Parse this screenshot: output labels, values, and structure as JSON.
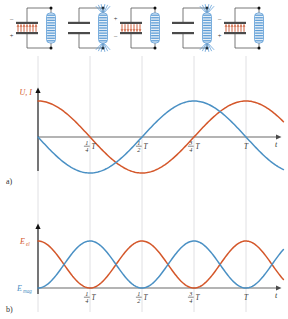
{
  "figure": {
    "panel_labels": {
      "a": "a)",
      "b": "b)"
    },
    "colors": {
      "orange": "#d4572a",
      "blue": "#4a90c4",
      "axis": "#6b6b6b",
      "guide": "#d8d8dc",
      "plate_dark": "#4a4a4a",
      "field_red": "#c8502a",
      "coil_blue": "#5b9bd5",
      "wire": "#555555"
    }
  },
  "circuits": [
    {
      "index": 0,
      "phase_label": "0",
      "capacitor": {
        "charged": true,
        "top_sign": "–",
        "bottom_sign": "+",
        "field_lines": true
      },
      "coil": {
        "field_lines": false
      }
    },
    {
      "index": 1,
      "phase_label": "1/4 T",
      "capacitor": {
        "charged": false,
        "top_sign": "",
        "bottom_sign": "",
        "field_lines": false
      },
      "coil": {
        "field_lines": true
      }
    },
    {
      "index": 2,
      "phase_label": "1/2 T",
      "capacitor": {
        "charged": true,
        "top_sign": "+",
        "bottom_sign": "–",
        "field_lines": true
      },
      "coil": {
        "field_lines": false
      }
    },
    {
      "index": 3,
      "phase_label": "3/4 T",
      "capacitor": {
        "charged": false,
        "top_sign": "",
        "bottom_sign": "",
        "field_lines": false
      },
      "coil": {
        "field_lines": true
      }
    },
    {
      "index": 4,
      "phase_label": "T",
      "capacitor": {
        "charged": true,
        "top_sign": "–",
        "bottom_sign": "+",
        "field_lines": true
      },
      "coil": {
        "field_lines": false
      }
    }
  ],
  "chart_data": [
    {
      "id": "panel-a",
      "type": "line",
      "title": "",
      "ylabel": "U, I",
      "xlabel": "t",
      "xticks": [
        "¼ T",
        "½ T",
        "¾ T",
        "T"
      ],
      "xtick_values": [
        0.25,
        0.5,
        0.75,
        1.0
      ],
      "xlim": [
        0,
        1.18
      ],
      "ylim": [
        -1.15,
        1.15
      ],
      "grid": true,
      "legend": "none",
      "series": [
        {
          "name": "U",
          "color": "#d4572a",
          "function": "cos(2*pi*t/T)",
          "x": [
            0,
            0.0625,
            0.125,
            0.1875,
            0.25,
            0.3125,
            0.375,
            0.4375,
            0.5,
            0.5625,
            0.625,
            0.6875,
            0.75,
            0.8125,
            0.875,
            0.9375,
            1.0,
            1.0625,
            1.125
          ],
          "values": [
            1.0,
            0.924,
            0.707,
            0.383,
            0.0,
            -0.383,
            -0.707,
            -0.924,
            -1.0,
            -0.924,
            -0.707,
            -0.383,
            0.0,
            0.383,
            0.707,
            0.924,
            1.0,
            0.924,
            0.707
          ]
        },
        {
          "name": "I",
          "color": "#4a90c4",
          "function": "-sin(2*pi*t/T)",
          "x": [
            0,
            0.0625,
            0.125,
            0.1875,
            0.25,
            0.3125,
            0.375,
            0.4375,
            0.5,
            0.5625,
            0.625,
            0.6875,
            0.75,
            0.8125,
            0.875,
            0.9375,
            1.0,
            1.0625,
            1.125
          ],
          "values": [
            0.0,
            -0.383,
            -0.707,
            -0.924,
            -1.0,
            -0.924,
            -0.707,
            -0.383,
            0.0,
            0.383,
            0.707,
            0.924,
            1.0,
            0.924,
            0.707,
            0.383,
            0.0,
            -0.383,
            -0.707
          ]
        }
      ]
    },
    {
      "id": "panel-b",
      "type": "line",
      "title": "",
      "ylabel_top": "E_el",
      "ylabel_bottom": "E_mag",
      "ylabel_top_text": "E",
      "ylabel_top_sub": "el",
      "ylabel_bottom_text": "E",
      "ylabel_bottom_sub": "mag",
      "xlabel": "t",
      "xticks": [
        "¼ T",
        "½ T",
        "¾ T",
        "T"
      ],
      "xtick_values": [
        0.25,
        0.5,
        0.75,
        1.0
      ],
      "xlim": [
        0,
        1.18
      ],
      "ylim": [
        0,
        1.1
      ],
      "grid": true,
      "legend": "none",
      "series": [
        {
          "name": "E_el",
          "color": "#d4572a",
          "function": "cos^2(2*pi*t/T)",
          "x": [
            0,
            0.0625,
            0.125,
            0.1875,
            0.25,
            0.3125,
            0.375,
            0.4375,
            0.5,
            0.5625,
            0.625,
            0.6875,
            0.75,
            0.8125,
            0.875,
            0.9375,
            1.0,
            1.0625,
            1.125
          ],
          "values": [
            1.0,
            0.854,
            0.5,
            0.146,
            0.0,
            0.146,
            0.5,
            0.854,
            1.0,
            0.854,
            0.5,
            0.146,
            0.0,
            0.146,
            0.5,
            0.854,
            1.0,
            0.854,
            0.5
          ]
        },
        {
          "name": "E_mag",
          "color": "#4a90c4",
          "function": "sin^2(2*pi*t/T)",
          "x": [
            0,
            0.0625,
            0.125,
            0.1875,
            0.25,
            0.3125,
            0.375,
            0.4375,
            0.5,
            0.5625,
            0.625,
            0.6875,
            0.75,
            0.8125,
            0.875,
            0.9375,
            1.0,
            1.0625,
            1.125
          ],
          "values": [
            0.0,
            0.146,
            0.5,
            0.854,
            1.0,
            0.854,
            0.5,
            0.146,
            0.0,
            0.146,
            0.5,
            0.854,
            1.0,
            0.854,
            0.5,
            0.146,
            0.0,
            0.146,
            0.5
          ]
        }
      ]
    }
  ],
  "tick_fractions": [
    {
      "num": "1",
      "den": "4",
      "unit": "T"
    },
    {
      "num": "1",
      "den": "2",
      "unit": "T"
    },
    {
      "num": "3",
      "den": "4",
      "unit": "T"
    },
    {
      "num": "",
      "den": "",
      "unit": "T"
    }
  ],
  "axis_labels": {
    "t": "t",
    "u_i": "U, I"
  }
}
